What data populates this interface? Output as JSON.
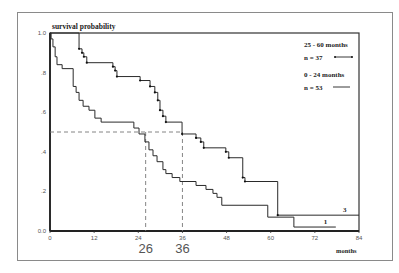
{
  "chart_data": {
    "type": "line",
    "subtype": "kaplan-meier step",
    "title": "",
    "ylabel": "survival probability",
    "xlabel": "months",
    "xlim": [
      0,
      84
    ],
    "ylim": [
      0.0,
      1.0
    ],
    "x_ticks": [
      "0",
      "12",
      "24",
      "36",
      "48",
      "60",
      "72",
      "84"
    ],
    "y_ticks": [
      "0.0",
      ".2",
      ".4",
      ".6",
      ".8",
      "1.0"
    ],
    "grid": false,
    "legend_position": "upper right",
    "series": [
      {
        "name": "25 - 60 months",
        "n_label": "n = 37",
        "end_label": "3",
        "marker": "censor ticks",
        "steps": [
          [
            0,
            1.0
          ],
          [
            7.9,
            0.92
          ],
          [
            8.7,
            0.9
          ],
          [
            9.2,
            0.88
          ],
          [
            10.0,
            0.85
          ],
          [
            17.1,
            0.83
          ],
          [
            17.7,
            0.81
          ],
          [
            18.2,
            0.78
          ],
          [
            24.5,
            0.76
          ],
          [
            27.2,
            0.73
          ],
          [
            28.5,
            0.7
          ],
          [
            29.3,
            0.66
          ],
          [
            29.9,
            0.61
          ],
          [
            30.7,
            0.58
          ],
          [
            31.5,
            0.55
          ],
          [
            35.9,
            0.49
          ],
          [
            39.7,
            0.47
          ],
          [
            41.0,
            0.45
          ],
          [
            41.8,
            0.42
          ],
          [
            47.8,
            0.4
          ],
          [
            48.6,
            0.37
          ],
          [
            52.4,
            0.27
          ],
          [
            53.0,
            0.25
          ],
          [
            61.9,
            0.08
          ],
          [
            84,
            0.08
          ]
        ]
      },
      {
        "name": "0 - 24 months",
        "n_label": "n = 53",
        "end_label": "1",
        "marker": "none",
        "steps": [
          [
            0,
            1.0
          ],
          [
            0.3,
            0.97
          ],
          [
            0.8,
            0.93
          ],
          [
            1.4,
            0.88
          ],
          [
            1.9,
            0.84
          ],
          [
            3.3,
            0.82
          ],
          [
            6.3,
            0.73
          ],
          [
            7.1,
            0.7
          ],
          [
            7.9,
            0.66
          ],
          [
            9.0,
            0.63
          ],
          [
            10.6,
            0.61
          ],
          [
            12.2,
            0.57
          ],
          [
            13.9,
            0.55
          ],
          [
            22.8,
            0.52
          ],
          [
            24.2,
            0.49
          ],
          [
            25.8,
            0.45
          ],
          [
            26.9,
            0.41
          ],
          [
            28.0,
            0.38
          ],
          [
            29.1,
            0.35
          ],
          [
            30.7,
            0.31
          ],
          [
            31.5,
            0.29
          ],
          [
            33.2,
            0.27
          ],
          [
            35.3,
            0.25
          ],
          [
            39.7,
            0.23
          ],
          [
            42.4,
            0.21
          ],
          [
            44.3,
            0.19
          ],
          [
            45.4,
            0.17
          ],
          [
            46.7,
            0.13
          ],
          [
            59.2,
            0.07
          ],
          [
            66.3,
            0.02
          ],
          [
            77.7,
            0.02
          ]
        ]
      }
    ],
    "annotations": {
      "median_line_y": 0.5,
      "median_markers": [
        {
          "x": 26,
          "label": "26"
        },
        {
          "x": 36,
          "label": "36"
        }
      ]
    }
  }
}
